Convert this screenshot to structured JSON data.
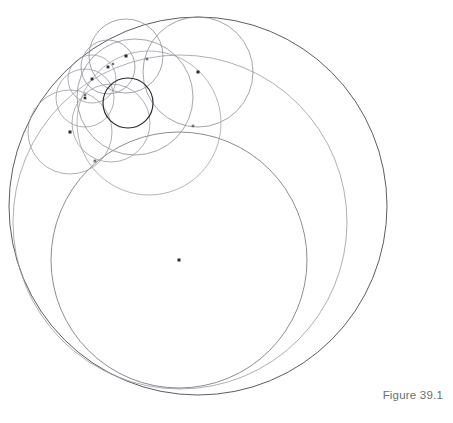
{
  "figure": {
    "caption": "Figure 39.1",
    "caption_color": "#6d6d6d",
    "background_color": "#ffffff",
    "width": 453,
    "height": 423
  },
  "chart_data": {
    "type": "scatter",
    "title": "Figure 39.1",
    "xlabel": "",
    "ylabel": "",
    "xlim": [
      0,
      453
    ],
    "ylim": [
      0,
      423
    ],
    "grid": false,
    "legend": "none",
    "circles": [
      {
        "name": "outer-boundary-circle",
        "cx": 198,
        "cy": 206,
        "r": 189,
        "stroke": "#4a4a52",
        "stroke_width": 0.9,
        "center_dot": false
      },
      {
        "name": "large-grey-circle",
        "cx": 180,
        "cy": 222,
        "r": 167,
        "stroke": "#9a9aa2",
        "stroke_width": 0.8,
        "center_dot": false
      },
      {
        "name": "chain-circle-1",
        "cx": 179,
        "cy": 260,
        "r": 128,
        "stroke": "#6f6f78",
        "stroke_width": 0.8,
        "center_dot": true
      },
      {
        "name": "chain-circle-2",
        "cx": 198,
        "cy": 72,
        "r": 55,
        "stroke": "#8d8d95",
        "stroke_width": 0.8,
        "center_dot": true
      },
      {
        "name": "chain-circle-3",
        "cx": 193,
        "cy": 126,
        "r": 0,
        "stroke": "#8d8d95",
        "stroke_width": 0.8,
        "center_dot": false
      },
      {
        "name": "chain-circle-4",
        "cx": 149,
        "cy": 123,
        "r": 72,
        "stroke": "#a2a2aa",
        "stroke_width": 0.8,
        "center_dot": false
      },
      {
        "name": "chain-circle-5",
        "cx": 126,
        "cy": 56,
        "r": 37,
        "stroke": "#8d8d95",
        "stroke_width": 0.8,
        "center_dot": true
      },
      {
        "name": "chain-circle-6",
        "cx": 108,
        "cy": 67,
        "r": 27,
        "stroke": "#8d8d95",
        "stroke_width": 0.8,
        "center_dot": true
      },
      {
        "name": "chain-circle-7",
        "cx": 92,
        "cy": 79,
        "r": 24,
        "stroke": "#9a9aa2",
        "stroke_width": 0.8,
        "center_dot": true
      },
      {
        "name": "chain-circle-8",
        "cx": 85,
        "cy": 98,
        "r": 29,
        "stroke": "#9a9aa2",
        "stroke_width": 0.8,
        "center_dot": true
      },
      {
        "name": "chain-circle-9",
        "cx": 70,
        "cy": 132,
        "r": 42,
        "stroke": "#9a9aa2",
        "stroke_width": 0.8,
        "center_dot": true
      },
      {
        "name": "chain-circle-10",
        "cx": 111,
        "cy": 123,
        "r": 39,
        "stroke": "#9a9aa2",
        "stroke_width": 0.8,
        "center_dot": false
      },
      {
        "name": "chain-circle-11",
        "cx": 135,
        "cy": 97,
        "r": 58,
        "stroke": "#8d8d95",
        "stroke_width": 0.8,
        "center_dot": false
      },
      {
        "name": "inner-dark-circle",
        "cx": 128,
        "cy": 103,
        "r": 25,
        "stroke": "#2b2b33",
        "stroke_width": 1.2,
        "center_dot": false
      }
    ],
    "centre_dots": [
      {
        "name": "centre-dot-chain-1",
        "x": 179,
        "y": 260,
        "size": 3.0,
        "color": "#2b2b33"
      },
      {
        "name": "centre-dot-chain-2",
        "x": 198,
        "y": 72,
        "size": 3.0,
        "color": "#2b2b33"
      },
      {
        "name": "centre-dot-chain-5",
        "x": 126,
        "y": 56,
        "size": 3.0,
        "color": "#2b2b33"
      },
      {
        "name": "centre-dot-chain-6",
        "x": 108,
        "y": 67,
        "size": 2.8,
        "color": "#2b2b33"
      },
      {
        "name": "centre-dot-chain-7",
        "x": 92,
        "y": 79,
        "size": 2.8,
        "color": "#2b2b33"
      },
      {
        "name": "centre-dot-chain-8",
        "x": 85,
        "y": 98,
        "size": 2.6,
        "color": "#2b2b33"
      },
      {
        "name": "centre-dot-chain-9",
        "x": 70,
        "y": 132,
        "size": 3.0,
        "color": "#2b2b33"
      }
    ],
    "tangency_nodes": [
      {
        "name": "tangency-node-a",
        "x": 147,
        "y": 59,
        "size": 2.6,
        "color": "#6e6e7a"
      },
      {
        "name": "tangency-node-b",
        "x": 193,
        "y": 126,
        "size": 2.6,
        "color": "#6e6e7a"
      },
      {
        "name": "tangency-node-c",
        "x": 95,
        "y": 161,
        "size": 2.8,
        "color": "#6e6e7a"
      },
      {
        "name": "tangency-node-d",
        "x": 85,
        "y": 95,
        "size": 2.4,
        "color": "#6e6e7a"
      },
      {
        "name": "tangency-node-e",
        "x": 113,
        "y": 64,
        "size": 2.4,
        "color": "#6e6e7a"
      }
    ]
  }
}
